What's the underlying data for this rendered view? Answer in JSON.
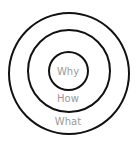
{
  "diagram": {
    "rings": [
      {
        "label": "Why"
      },
      {
        "label": "How"
      },
      {
        "label": "What"
      }
    ],
    "colors": {
      "stroke": "#111111",
      "text": "#9a9a9a",
      "background": "#ffffff"
    }
  }
}
